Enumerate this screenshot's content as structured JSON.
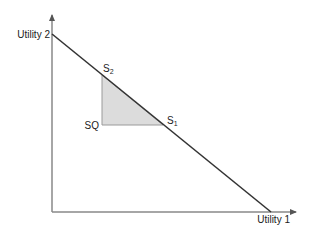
{
  "diagram": {
    "type": "utility-possibility-frontier",
    "axes": {
      "x_label": "Utility 1",
      "y_label": "Utility 2"
    },
    "points": {
      "status_quo": "SQ",
      "s1": {
        "base": "S",
        "sub": "1"
      },
      "s2": {
        "base": "S",
        "sub": "2"
      }
    },
    "colors": {
      "axis": "#888888",
      "frontier": "#333333",
      "triangle_fill": "#dcdcdc",
      "triangle_edge": "#999999"
    }
  }
}
